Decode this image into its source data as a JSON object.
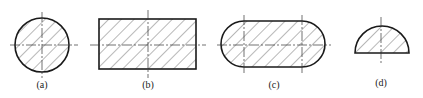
{
  "figure": {
    "panels": [
      {
        "id": "a",
        "label": "(a)",
        "shape": "circle"
      },
      {
        "id": "b",
        "label": "(b)",
        "shape": "rectangle"
      },
      {
        "id": "c",
        "label": "(c)",
        "shape": "slot (stadium / obround)"
      },
      {
        "id": "d",
        "label": "(d)",
        "shape": "semicircle"
      }
    ],
    "style": {
      "outline_color": "#1a1a1a",
      "hatch_color": "#333333",
      "hatch_angle_deg": 45,
      "background": "#ffffff"
    }
  }
}
